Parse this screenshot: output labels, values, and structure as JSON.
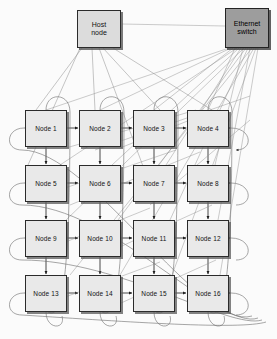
{
  "diagram": {
    "background_color": "#fbfbfb",
    "line_color": "#6b6b6b",
    "node_fill": "#e9e9e9",
    "host_fill": "#dcdcdc",
    "switch_fill": "#9d9d9d",
    "border_color": "#2b2b2b"
  },
  "host": {
    "label_line1": "Host",
    "label_line2": "node",
    "x": 77,
    "y": 10,
    "w": 44,
    "h": 38
  },
  "switch": {
    "label_line1": "Ethernet",
    "label_line2": "switch",
    "x": 225,
    "y": 8,
    "w": 44,
    "h": 40
  },
  "grid": {
    "rows": 4,
    "cols": 4,
    "box_w": 42,
    "box_h": 37,
    "col_x": [
      25,
      79,
      133,
      187
    ],
    "row_y": [
      110,
      165,
      220,
      275
    ]
  },
  "nodes": [
    {
      "label": "Node 1",
      "row": 0,
      "col": 0
    },
    {
      "label": "Node 2",
      "row": 0,
      "col": 1
    },
    {
      "label": "Node 3",
      "row": 0,
      "col": 2
    },
    {
      "label": "Node 4",
      "row": 0,
      "col": 3
    },
    {
      "label": "Node 5",
      "row": 1,
      "col": 0
    },
    {
      "label": "Node 6",
      "row": 1,
      "col": 1
    },
    {
      "label": "Node 7",
      "row": 1,
      "col": 2
    },
    {
      "label": "Node 8",
      "row": 1,
      "col": 3
    },
    {
      "label": "Node 9",
      "row": 2,
      "col": 0
    },
    {
      "label": "Node 10",
      "row": 2,
      "col": 1
    },
    {
      "label": "Node 11",
      "row": 2,
      "col": 2
    },
    {
      "label": "Node 12",
      "row": 2,
      "col": 3
    },
    {
      "label": "Node 13",
      "row": 3,
      "col": 0
    },
    {
      "label": "Node 14",
      "row": 3,
      "col": 1
    },
    {
      "label": "Node 15",
      "row": 3,
      "col": 2
    },
    {
      "label": "Node 16",
      "row": 3,
      "col": 3
    }
  ]
}
